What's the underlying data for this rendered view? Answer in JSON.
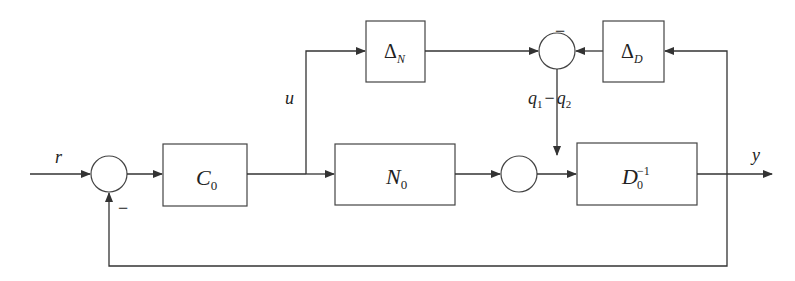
{
  "diagram": {
    "type": "control-block-diagram",
    "signals": {
      "input": "r",
      "control": "u",
      "output": "y",
      "perturbation": {
        "q1": "q",
        "q1_sub": "1",
        "op": "−",
        "q2": "q",
        "q2_sub": "2"
      }
    },
    "blocks": [
      {
        "id": "C0",
        "main": "C",
        "sub": "0",
        "sup": ""
      },
      {
        "id": "N0",
        "main": "N",
        "sub": "0",
        "sup": ""
      },
      {
        "id": "D0inv",
        "main": "D",
        "sub": "0",
        "sup": "−1"
      },
      {
        "id": "DeltaN",
        "main": "Δ",
        "sub": "N",
        "sup": ""
      },
      {
        "id": "DeltaD",
        "main": "Δ",
        "sub": "D",
        "sup": ""
      }
    ],
    "summing_junctions": [
      {
        "id": "sum-input",
        "sign_label": "−"
      },
      {
        "id": "sum-uncertainty",
        "sign_label": "−"
      },
      {
        "id": "sum-plant",
        "sign_label": ""
      }
    ],
    "colors": {
      "line": "#333333",
      "background": "#ffffff"
    }
  }
}
